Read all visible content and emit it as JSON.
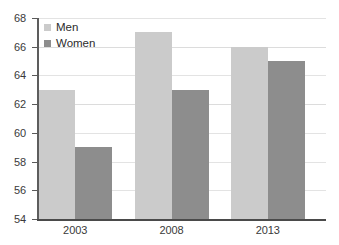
{
  "chart_data": {
    "type": "bar",
    "title": "",
    "subtitle": "",
    "xlabel": "",
    "ylabel": "",
    "categories": [
      "2003",
      "2008",
      "2013"
    ],
    "series": [
      {
        "name": "Men",
        "color": "#cbcbcb",
        "values": [
          63,
          67,
          66
        ]
      },
      {
        "name": "Women",
        "color": "#8d8d8d",
        "values": [
          59,
          63,
          65
        ]
      }
    ],
    "ylim": [
      54,
      68
    ],
    "ytick_step": 2,
    "ytick_labels": [
      "68",
      "66",
      "64",
      "62",
      "60",
      "58",
      "56",
      "54"
    ],
    "ytick_values": [
      68,
      66,
      64,
      62,
      60,
      58,
      56,
      54
    ],
    "grid": true,
    "grid_axis": "y",
    "legend_position": "top-left",
    "orientation": "vertical",
    "grouping": "grouped"
  },
  "style": {
    "background": "#ffffff",
    "grid_color": "#e3e3e3",
    "axis_color": "#4a4a4a",
    "tick_text_color": "#3a3a3a",
    "legend_text_color": "#2b2b2b"
  }
}
